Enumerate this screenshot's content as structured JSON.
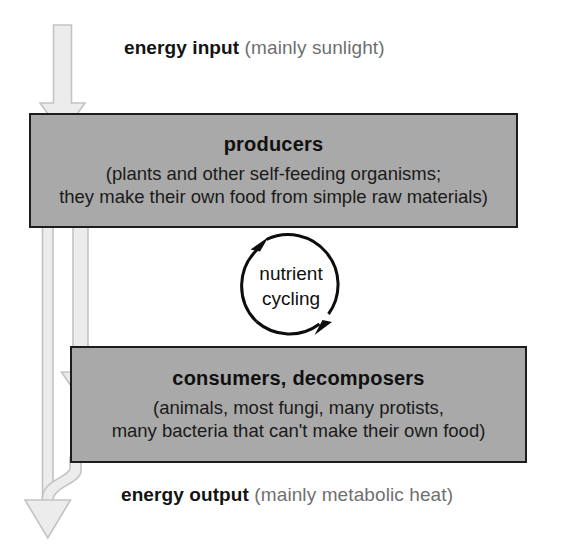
{
  "diagram": {
    "energy_input": {
      "strong": "energy input",
      "soft": "(mainly sunlight)"
    },
    "energy_output": {
      "strong": "energy output",
      "soft": "(mainly metabolic heat)"
    },
    "producers": {
      "title": "producers",
      "description": "(plants and other self-feeding organisms;\nthey make their own food from simple raw materials)"
    },
    "consumers": {
      "title": "consumers, decomposers",
      "description": "(animals, most fungi, many protists,\nmany bacteria that can't make their own food)"
    },
    "nutrient_cycling": {
      "label": "nutrient\ncycling"
    },
    "colors": {
      "box_fill": "#a9a9a9",
      "box_stroke": "#1d1d1d",
      "arrow_fill": "#ececec",
      "arrow_stroke": "#c2c2c2",
      "text_strong": "#131313",
      "text_soft": "#6f6f6f",
      "background": "#ffffff"
    }
  }
}
